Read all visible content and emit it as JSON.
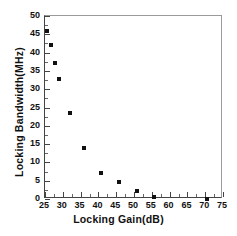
{
  "chart_data": {
    "type": "scatter",
    "title": "",
    "xlabel": "Locking Gain(dB)",
    "ylabel": "Locking Bandwidth(MHz)",
    "xlim": [
      25,
      75
    ],
    "ylim": [
      0,
      50
    ],
    "xticks": [
      25,
      30,
      35,
      40,
      45,
      50,
      55,
      60,
      65,
      70,
      75
    ],
    "yticks": [
      0,
      5,
      10,
      15,
      20,
      25,
      30,
      35,
      40,
      45,
      50
    ],
    "xtick_labels": [
      "25",
      "30",
      "35",
      "40",
      "45",
      "50",
      "55",
      "60",
      "65",
      "70",
      "75"
    ],
    "ytick_labels": [
      "0",
      "5",
      "10",
      "15",
      "20",
      "25",
      "30",
      "35",
      "40",
      "45",
      "50"
    ],
    "minor_ticks": true,
    "grid": false,
    "legend": false,
    "marker": "square",
    "marker_color": "#111111",
    "series": [
      {
        "name": "Locking Bandwidth vs Locking Gain",
        "points": [
          {
            "x": 25.5,
            "y": 46.0
          },
          {
            "x": 26.8,
            "y": 42.0
          },
          {
            "x": 27.9,
            "y": 37.1
          },
          {
            "x": 28.9,
            "y": 32.8
          },
          {
            "x": 32.1,
            "y": 23.5
          },
          {
            "x": 35.9,
            "y": 14.0
          },
          {
            "x": 40.6,
            "y": 7.2
          },
          {
            "x": 45.8,
            "y": 4.7
          },
          {
            "x": 50.8,
            "y": 2.3
          },
          {
            "x": 55.7,
            "y": 0.5
          },
          {
            "x": 70.5,
            "y": 0.0
          }
        ]
      }
    ]
  }
}
